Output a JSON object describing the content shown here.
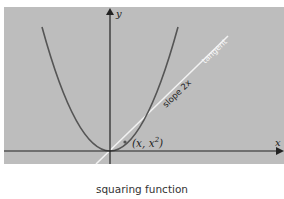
{
  "figure": {
    "caption": "squaring function",
    "colors": {
      "panel": "#bdbdbd",
      "axis": "#222222",
      "curve": "#555555",
      "tangent": "#f2f2f2",
      "background": "#ffffff"
    },
    "axes": {
      "x_label": "x",
      "y_label": "y"
    },
    "curve": {
      "name": "parabola",
      "equation": "y = x^2"
    },
    "tangent": {
      "label": "tangent",
      "slope_label": "slope 2x"
    },
    "point": {
      "label_prefix": "(x, x",
      "label_sup": "2",
      "label_suffix": ")"
    }
  }
}
